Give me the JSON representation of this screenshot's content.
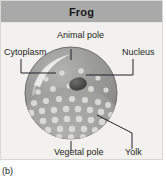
{
  "panel": {
    "title": "Frog"
  },
  "caption": "(b)",
  "labels": {
    "animal_pole": "Animal pole",
    "cytoplasm": "Cytoplasm",
    "nucleus": "Nucleus",
    "vegetal_pole": "Vegetal pole",
    "yolk": "Yolk"
  },
  "colors": {
    "header_bg": "#a9a9a9",
    "panel_bg": "#f2f1ef",
    "panel_border": "#d9d7d3",
    "text": "#1d1d20",
    "egg_upper": "#9a9a99",
    "egg_lower": "#b0b0ae",
    "egg_edge": "#6f6f6e",
    "nucleus": "#4a4a49",
    "yolk_granule": "#dededa",
    "highlight": "#f4f4f1",
    "leader_line": "#23232a"
  }
}
